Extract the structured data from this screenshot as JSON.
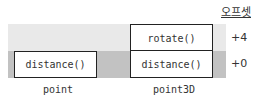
{
  "header": {
    "offset_label": "오프셋"
  },
  "offsets": [
    "+4",
    "+0"
  ],
  "objects": [
    {
      "name": "point",
      "methods": [
        "distance()"
      ]
    },
    {
      "name": "point3D",
      "methods": [
        "rotate()",
        "distance()"
      ]
    }
  ],
  "colors": {
    "upper_band": "#e9e9e9",
    "lower_band": "#c2c2c2",
    "box_border": "#222222"
  }
}
